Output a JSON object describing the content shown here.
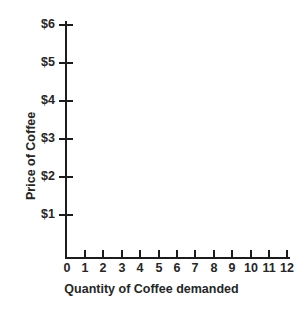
{
  "chart_data": {
    "type": "line",
    "title": "",
    "subtitle": "",
    "xlabel": "Quantity of Coffee demanded",
    "ylabel": "Price of Coffee",
    "x_tick_labels": [
      "0",
      "1",
      "2",
      "3",
      "4",
      "5",
      "6",
      "7",
      "8",
      "9",
      "10",
      "11",
      "12"
    ],
    "x_tick_values": [
      0,
      1,
      2,
      3,
      4,
      5,
      6,
      7,
      8,
      9,
      10,
      11,
      12
    ],
    "y_tick_labels": [
      "$1",
      "$2",
      "$3",
      "$4",
      "$5",
      "$6"
    ],
    "y_tick_values": [
      1,
      2,
      3,
      4,
      5,
      6
    ],
    "xlim": [
      0,
      12
    ],
    "ylim": [
      0,
      6.25
    ],
    "grid": false,
    "legend": false,
    "legend_position": "none",
    "series": [],
    "values": [],
    "categories": [],
    "annotations": [],
    "note": "Empty plotting grid: axes drawn with tick marks and labels, no data plotted."
  },
  "axes": {
    "y_title": "Price of Coffee",
    "x_title": "Quantity of Coffee demanded",
    "y_ticks": [
      {
        "label": "$6",
        "value": 6,
        "top": 24
      },
      {
        "label": "$5",
        "value": 5,
        "top": 62
      },
      {
        "label": "$4",
        "value": 4,
        "top": 100
      },
      {
        "label": "$3",
        "value": 3,
        "top": 138
      },
      {
        "label": "$2",
        "value": 2,
        "top": 176
      },
      {
        "label": "$1",
        "value": 1,
        "top": 214
      }
    ],
    "x_ticks": [
      {
        "label": "0",
        "value": 0,
        "left": 66
      },
      {
        "label": "1",
        "value": 1,
        "left": 84
      },
      {
        "label": "2",
        "value": 2,
        "left": 102
      },
      {
        "label": "3",
        "value": 3,
        "left": 121
      },
      {
        "label": "4",
        "value": 4,
        "left": 139
      },
      {
        "label": "5",
        "value": 5,
        "left": 158
      },
      {
        "label": "6",
        "value": 6,
        "left": 176
      },
      {
        "label": "7",
        "value": 7,
        "left": 194
      },
      {
        "label": "8",
        "value": 8,
        "left": 213
      },
      {
        "label": "9",
        "value": 9,
        "left": 231
      },
      {
        "label": "10",
        "value": 10,
        "left": 250
      },
      {
        "label": "11",
        "value": 11,
        "left": 268
      },
      {
        "label": "12",
        "value": 12,
        "left": 286
      }
    ]
  },
  "colors": {
    "background": "#ffffff",
    "axis": "#1c1c1c",
    "text": "#262626"
  }
}
